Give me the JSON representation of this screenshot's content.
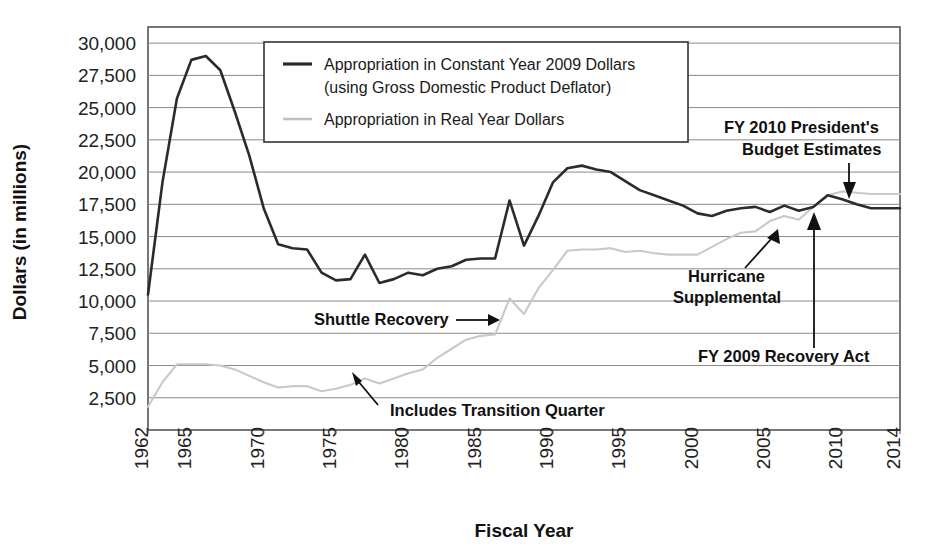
{
  "chart_data": {
    "type": "line",
    "title": "",
    "xlabel": "Fiscal Year",
    "ylabel": "Dollars (in millions)",
    "xlim": [
      1962,
      2014
    ],
    "ylim": [
      0,
      31250
    ],
    "grid": true,
    "legend_position": "top-center-inside",
    "y_ticks": [
      "2,500",
      "5,000",
      "7,500",
      "10,000",
      "12,500",
      "15,000",
      "17,500",
      "20,000",
      "22,500",
      "25,000",
      "27,500",
      "30,000"
    ],
    "y_tick_values": [
      2500,
      5000,
      7500,
      10000,
      12500,
      15000,
      17500,
      20000,
      22500,
      25000,
      27500,
      30000
    ],
    "x_ticks": [
      "1962",
      "1965",
      "1970",
      "1975",
      "1980",
      "1985",
      "1990",
      "1995",
      "2000",
      "2005",
      "2010",
      "2014"
    ],
    "x_tick_values": [
      1962,
      1965,
      1970,
      1975,
      1980,
      1985,
      1990,
      1995,
      2000,
      2005,
      2010,
      2014
    ],
    "x": [
      1962,
      1963,
      1964,
      1965,
      1966,
      1967,
      1968,
      1969,
      1970,
      1971,
      1972,
      1973,
      1974,
      1975,
      1976,
      1977,
      1978,
      1979,
      1980,
      1981,
      1982,
      1983,
      1984,
      1985,
      1986,
      1987,
      1988,
      1989,
      1990,
      1991,
      1992,
      1993,
      1994,
      1995,
      1996,
      1997,
      1998,
      1999,
      2000,
      2001,
      2002,
      2003,
      2004,
      2005,
      2006,
      2007,
      2008,
      2009,
      2010,
      2011,
      2012,
      2013,
      2014
    ],
    "series": [
      {
        "name": "Appropriation in Constant Year 2009 Dollars (using Gross Domestic Product Deflator)",
        "color": "#2b2b2b",
        "values": [
          10500,
          19200,
          25700,
          28700,
          29000,
          27900,
          24700,
          21300,
          17200,
          14400,
          14100,
          14000,
          12200,
          11600,
          11700,
          13600,
          11400,
          11700,
          12200,
          12000,
          12500,
          12700,
          13200,
          13300,
          13300,
          17800,
          14300,
          16600,
          19200,
          20300,
          20500,
          20200,
          20000,
          19300,
          18600,
          18200,
          17800,
          17400,
          16800,
          16600,
          17000,
          17200,
          17300,
          16900,
          17400,
          17000,
          17300,
          18200,
          17900,
          17500,
          17200,
          17200,
          17200
        ]
      },
      {
        "name": "Appropriation in Real Year Dollars",
        "color": "#c9c9c9",
        "values": [
          1800,
          3700,
          5100,
          5100,
          5100,
          5000,
          4700,
          4200,
          3700,
          3300,
          3400,
          3400,
          3000,
          3200,
          3500,
          4000,
          3600,
          4000,
          4400,
          4700,
          5600,
          6300,
          7000,
          7300,
          7400,
          10200,
          9000,
          11000,
          12400,
          13900,
          14000,
          14000,
          14100,
          13800,
          13900,
          13700,
          13600,
          13600,
          13600,
          14200,
          14800,
          15300,
          15400,
          16200,
          16600,
          16300,
          17300,
          18200,
          18500,
          18400,
          18300,
          18300,
          18300
        ]
      }
    ],
    "annotations": [
      {
        "id": "shuttle-recovery",
        "text": "Shuttle Recovery"
      },
      {
        "id": "includes-transition-quarter",
        "text": "Includes Transition Quarter"
      },
      {
        "id": "hurricane-supplemental",
        "text": "Hurricane\nSupplemental"
      },
      {
        "id": "hurricane-supplemental-line1",
        "text": "Hurricane"
      },
      {
        "id": "hurricane-supplemental-line2",
        "text": "Supplemental"
      },
      {
        "id": "fy-2009-recovery-act",
        "text": "FY 2009 Recovery Act"
      },
      {
        "id": "fy-2010-president-budget-line1",
        "text": "FY 2010 President's"
      },
      {
        "id": "fy-2010-president-budget-line2",
        "text": "Budget Estimates"
      }
    ],
    "legend": {
      "entries": [
        {
          "label_line1": "Appropriation in Constant Year 2009 Dollars",
          "label_line2": "(using Gross Domestic Product Deflator)",
          "color": "#2b2b2b"
        },
        {
          "label_line1": "Appropriation in Real Year Dollars",
          "label_line2": "",
          "color": "#c9c9c9"
        }
      ]
    }
  }
}
